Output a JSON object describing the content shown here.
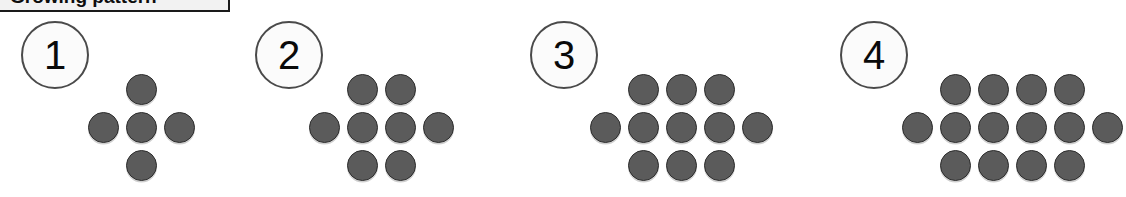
{
  "caption": {
    "text": "Growing pattern"
  },
  "colors": {
    "background": "#ffffff",
    "dot_fill": "#5b5b5b",
    "dot_stroke": "#2e2e2e",
    "label_circle_fill": "#fbfbfb",
    "label_circle_stroke": "#4a4a4a",
    "caption_box_fill": "#f2f2f2",
    "caption_box_stroke": "#1a1a1a",
    "text": "#0a0a0a"
  },
  "chart_data": {
    "type": "scatter",
    "title": "Growing pattern",
    "xlabel": "Figure number",
    "ylabel": "Number of dots",
    "categories": [
      "1",
      "2",
      "3",
      "4"
    ],
    "values": [
      5,
      8,
      11,
      14
    ],
    "series": [
      {
        "name": "Total dots",
        "values": [
          5,
          8,
          11,
          14
        ]
      },
      {
        "name": "Top row dots",
        "values": [
          1,
          2,
          3,
          4
        ]
      },
      {
        "name": "Middle row dots",
        "values": [
          3,
          4,
          5,
          6
        ]
      },
      {
        "name": "Bottom row dots",
        "values": [
          1,
          2,
          3,
          4
        ]
      }
    ],
    "common_difference": 3,
    "grid": false,
    "legend": "none",
    "annotations": [
      "Each figure adds 3 dots to the previous figure.",
      "Figure n has 3n + 2 dots."
    ]
  },
  "figures": [
    {
      "label": "1",
      "total_dots": 5,
      "rows": [
        {
          "name": "top",
          "offset": 1,
          "count": 1
        },
        {
          "name": "middle",
          "offset": 0,
          "count": 3
        },
        {
          "name": "bottom",
          "offset": 1,
          "count": 1
        }
      ]
    },
    {
      "label": "2",
      "total_dots": 8,
      "rows": [
        {
          "name": "top",
          "offset": 1,
          "count": 2
        },
        {
          "name": "middle",
          "offset": 0,
          "count": 4
        },
        {
          "name": "bottom",
          "offset": 1,
          "count": 2
        }
      ]
    },
    {
      "label": "3",
      "total_dots": 11,
      "rows": [
        {
          "name": "top",
          "offset": 1,
          "count": 3
        },
        {
          "name": "middle",
          "offset": 0,
          "count": 5
        },
        {
          "name": "bottom",
          "offset": 1,
          "count": 3
        }
      ]
    },
    {
      "label": "4",
      "total_dots": 14,
      "rows": [
        {
          "name": "top",
          "offset": 1,
          "count": 4
        },
        {
          "name": "middle",
          "offset": 0,
          "count": 6
        },
        {
          "name": "bottom",
          "offset": 1,
          "count": 4
        }
      ]
    }
  ],
  "layout": {
    "groups": [
      {
        "number_x": 21,
        "number_y": 21,
        "grid_x": 84,
        "grid_y": 70
      },
      {
        "number_x": 255,
        "number_y": 21,
        "grid_x": 305,
        "grid_y": 70
      },
      {
        "number_x": 530,
        "number_y": 21,
        "grid_x": 586,
        "grid_y": 70
      },
      {
        "number_x": 840,
        "number_y": 21,
        "grid_x": 898,
        "grid_y": 70
      }
    ]
  }
}
